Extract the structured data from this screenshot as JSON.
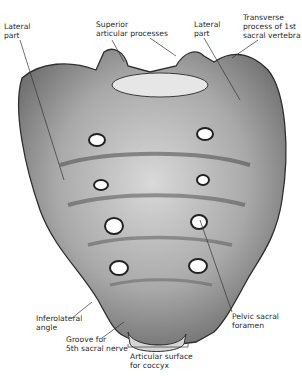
{
  "figure": {
    "labels": [
      {
        "id": "lateral-part-left",
        "text": "Lateral\npart",
        "x": 4,
        "y": 22
      },
      {
        "id": "superior-articular-processes",
        "text": "Superior\narticular processes",
        "x": 96,
        "y": 20
      },
      {
        "id": "lateral-part-right",
        "text": "Lateral\npart",
        "x": 194,
        "y": 20
      },
      {
        "id": "transverse-process",
        "text": "Transverse\nprocess of 1st\nsacral vertebra",
        "x": 243,
        "y": 13
      },
      {
        "id": "inferolateral-angle",
        "text": "Inferolateral\nangle",
        "x": 36,
        "y": 314
      },
      {
        "id": "groove-5th-sacral-nerve",
        "text": "Groove for\n5th sacral nerve",
        "x": 66,
        "y": 335
      },
      {
        "id": "pelvic-sacral-foramen",
        "text": "Pelvic sacral\nforamen",
        "x": 232,
        "y": 312
      },
      {
        "id": "articular-surface-coccyx",
        "text": "Articular surface\nfor coccyx",
        "x": 130,
        "y": 352
      }
    ]
  }
}
